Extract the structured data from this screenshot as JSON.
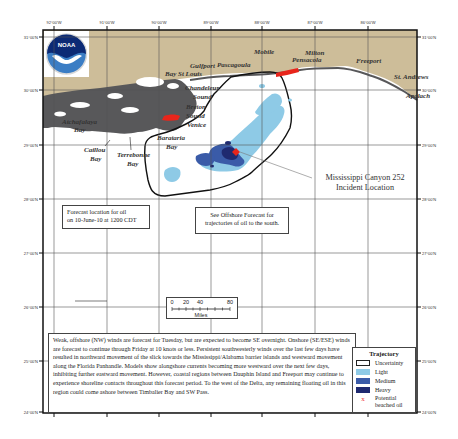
{
  "map": {
    "agency_logo": "NOAA",
    "colors": {
      "land": "#cdbd99",
      "marsh": "#58585a",
      "water": "#ffffff",
      "light": "#8ecae6",
      "medium": "#3a5ba8",
      "heavy": "#1f2a70",
      "beached": "#e8251b",
      "uncertainty": "#111111",
      "grid": "#555555"
    },
    "longitude_ticks": [
      "92°00'W",
      "91°00'W",
      "90°00'W",
      "89°00'W",
      "88°00'W",
      "87°00'W",
      "86°00'W"
    ],
    "latitude_ticks_left": [
      "31°00'N",
      "30°00'N",
      "29°00'N",
      "28°00'N",
      "27°00'N",
      "26°00'N",
      "25°00'N",
      "24°00'N"
    ],
    "latitude_ticks_right": [
      "31°00'N",
      "30°00'N",
      "29°00'N",
      "28°00'N",
      "27°00'N",
      "26°00'N",
      "25°00'N",
      "24°00'N"
    ],
    "place_names": {
      "mobile": "Mobile",
      "milton": "Milton",
      "pensacola": "Pensacola",
      "freeport": "Freeport",
      "st_andrews": "St. Andrews",
      "apalachicola": "Apalach",
      "gulfport": "Gulfport",
      "pascagoula": "Pascagoula",
      "bay_st_louis": "Bay St Louis",
      "chandeleur_sound": "Chandeleur",
      "chandeleur_sound_2": "Sound",
      "breton_sound": "Breton",
      "breton_sound_2": "Sound",
      "venice": "Venice",
      "atchafalaya_bay": "Atchafalaya",
      "atchafalaya_bay_2": "Bay",
      "caillou_bay": "Caillou",
      "caillou_bay_2": "Bay",
      "terrebonne_bay": "Terrebonne",
      "terrebonne_bay_2": "Bay",
      "barataria_bay": "Barataria",
      "barataria_bay_2": "Bay"
    },
    "incident_label": {
      "line1": "Mississippi Canyon 252",
      "line2": "Incident Location"
    }
  },
  "forecast_box": {
    "line1": "Forecast location for oil",
    "line2": "on 10-June-10 at 1200 CDT"
  },
  "offshore_box": {
    "line1": "See Offshore Forecast for",
    "line2": "trajectories of oil to the south."
  },
  "scale_bar": {
    "labels": [
      "0",
      "20",
      "40",
      "80"
    ],
    "unit": "Miles"
  },
  "discussion": {
    "text": "Weak, offshore (NW) winds are forecast for Tuesday, but are expected to become SE overnight. Onshore (SE/ESE) winds are forecast to continue through Friday at 10 knots or less. Persistent southwesterly winds over the last few days have resulted in northward movement of the slick towards the Mississippi/Alabama barrier islands and westward movement along the Florida Panhandle. Models show alongshore currents becoming more westward over the next few days, inhibiting further eastward movement. However, coastal regions between Dauphin Island and Freeport may continue to experience shoreline contacts throughout this forecast period. To the west of the Delta, any remaining floating oil in this region could come ashore between Timbalier Bay and SW Pass."
  },
  "legend": {
    "title": "Trajectory",
    "items": [
      {
        "label": "Uncertainty",
        "color": "#ffffff",
        "border": "#222222"
      },
      {
        "label": "Light",
        "color": "#8ecae6",
        "border": "#8ecae6"
      },
      {
        "label": "Medium",
        "color": "#3a5ba8",
        "border": "#3a5ba8"
      },
      {
        "label": "Heavy",
        "color": "#1f2a70",
        "border": "#1f2a70"
      }
    ],
    "beached_marker": "x",
    "beached_line1": "Potential",
    "beached_line2": "beached oil"
  }
}
